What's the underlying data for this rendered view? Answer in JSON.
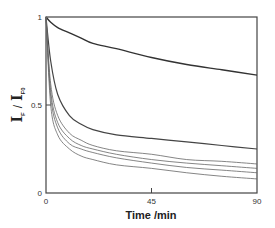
{
  "chart_data": {
    "type": "line",
    "title": "",
    "xlabel": "Time /min",
    "ylabel": "I_F / I_F0",
    "ylabel_parts": {
      "i1": "I",
      "sub1": "F",
      "slash": "/",
      "i2": "I",
      "sub2": "F0"
    },
    "xlim": [
      0,
      90
    ],
    "ylim": [
      0,
      1
    ],
    "xticks": [
      0,
      45,
      90
    ],
    "xtick_labels": [
      "0",
      "45",
      "90"
    ],
    "yticks": [
      0,
      0.5,
      1
    ],
    "ytick_labels": [
      "0",
      "0.5",
      "1"
    ],
    "grid": false,
    "legend": null,
    "x": [
      0,
      2,
      5,
      10,
      15,
      20,
      30,
      45,
      60,
      75,
      90
    ],
    "series": [
      {
        "name": "curve-1",
        "color": "#333333",
        "width": 1.4,
        "values": [
          1.0,
          0.97,
          0.94,
          0.91,
          0.88,
          0.85,
          0.82,
          0.77,
          0.73,
          0.7,
          0.67
        ]
      },
      {
        "name": "curve-2",
        "color": "#444444",
        "width": 1.2,
        "values": [
          1.0,
          0.75,
          0.56,
          0.44,
          0.39,
          0.36,
          0.33,
          0.31,
          0.29,
          0.27,
          0.25
        ]
      },
      {
        "name": "curve-3",
        "color": "#666666",
        "width": 0.8,
        "values": [
          1.0,
          0.62,
          0.44,
          0.34,
          0.3,
          0.27,
          0.24,
          0.22,
          0.19,
          0.18,
          0.165
        ]
      },
      {
        "name": "curve-4",
        "color": "#666666",
        "width": 0.8,
        "values": [
          1.0,
          0.58,
          0.4,
          0.31,
          0.27,
          0.25,
          0.22,
          0.19,
          0.17,
          0.155,
          0.14
        ]
      },
      {
        "name": "curve-5",
        "color": "#666666",
        "width": 0.8,
        "values": [
          1.0,
          0.55,
          0.37,
          0.28,
          0.25,
          0.23,
          0.2,
          0.17,
          0.145,
          0.13,
          0.115
        ]
      },
      {
        "name": "curve-6",
        "color": "#666666",
        "width": 0.8,
        "values": [
          1.0,
          0.5,
          0.33,
          0.25,
          0.21,
          0.19,
          0.16,
          0.14,
          0.115,
          0.095,
          0.08
        ]
      }
    ]
  },
  "plot": {
    "left": 46,
    "top": 17,
    "right": 257,
    "bottom": 193,
    "frame_color": "#444444",
    "text_color": "#222222"
  }
}
